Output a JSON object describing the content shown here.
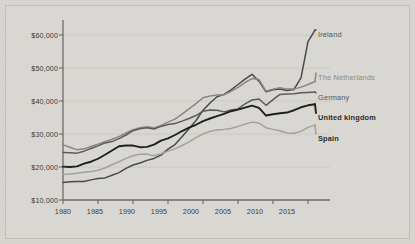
{
  "chart_data": {
    "type": "line",
    "title": "",
    "subtitle": "",
    "xlabel": "",
    "ylabel": "",
    "xlim": [
      1980,
      2017
    ],
    "ylim": [
      10000,
      62000
    ],
    "grid": "horizontal",
    "legend_position": "right-inline-end-of-line",
    "y_ticks": [
      "$10,000",
      "$20,000",
      "$30,000",
      "$40,000",
      "$50,000",
      "$60,000"
    ],
    "y_tick_values": [
      10000,
      20000,
      30000,
      40000,
      50000,
      60000
    ],
    "x_ticks": [
      "1980",
      "1985",
      "1990",
      "1995",
      "2000",
      "2005",
      "2010",
      "2015"
    ],
    "x_tick_values": [
      1980,
      1985,
      1990,
      1995,
      2000,
      2005,
      2010,
      2015
    ],
    "x": [
      1980,
      1981,
      1982,
      1983,
      1984,
      1985,
      1986,
      1987,
      1988,
      1989,
      1990,
      1991,
      1992,
      1993,
      1994,
      1995,
      1996,
      1997,
      1998,
      1999,
      2000,
      2001,
      2002,
      2003,
      2004,
      2005,
      2006,
      2007,
      2008,
      2009,
      2010,
      2011,
      2012,
      2013,
      2014,
      2015,
      2016
    ],
    "series": [
      {
        "name": "Ireland",
        "color": "#4a4a4a",
        "width": 1.5,
        "label_style": "mid",
        "values": [
          15300,
          15500,
          15600,
          15600,
          16100,
          16500,
          16700,
          17500,
          18300,
          19600,
          20600,
          21200,
          22000,
          22600,
          23600,
          25400,
          26800,
          29200,
          31600,
          34100,
          37200,
          39400,
          41300,
          42000,
          43400,
          45000,
          46600,
          48100,
          46000,
          42800,
          43400,
          43600,
          43200,
          43500,
          47000,
          58000,
          61500
        ]
      },
      {
        "name": "The Netherlands",
        "color": "#8a8882",
        "width": 1.5,
        "label_style": "light",
        "values": [
          26700,
          26000,
          25200,
          25500,
          26200,
          26900,
          27700,
          28400,
          29200,
          30300,
          31300,
          31900,
          32200,
          31800,
          32600,
          33600,
          34500,
          36000,
          37600,
          39200,
          41000,
          41500,
          41800,
          41900,
          42900,
          44100,
          45600,
          46800,
          46500,
          43000,
          43600,
          44000,
          43600,
          43600,
          44200,
          45000,
          45900
        ]
      },
      {
        "name": "Germany",
        "color": "#5d5c5a",
        "width": 1.5,
        "label_style": "mid",
        "values": [
          24400,
          24300,
          24200,
          24800,
          25600,
          26400,
          27300,
          27700,
          28600,
          29700,
          31000,
          31600,
          31900,
          31500,
          32300,
          32900,
          33200,
          33900,
          34700,
          35600,
          36900,
          37300,
          37200,
          36700,
          37300,
          37600,
          39100,
          40300,
          40600,
          38700,
          40400,
          42000,
          42100,
          42200,
          42500,
          42600,
          42700
        ]
      },
      {
        "name": "United kingdom",
        "color": "#1e1e1e",
        "width": 1.9,
        "label_style": "dark",
        "values": [
          20100,
          20000,
          20200,
          21000,
          21600,
          22500,
          23700,
          25000,
          26300,
          26500,
          26500,
          26000,
          26100,
          26800,
          28000,
          28700,
          29700,
          30900,
          31900,
          32800,
          33900,
          34700,
          35400,
          36100,
          36900,
          37400,
          38000,
          38600,
          37900,
          35600,
          36000,
          36300,
          36500,
          37200,
          38100,
          38700,
          39000
        ]
      },
      {
        "name": "Spain",
        "color": "#a3a19c",
        "width": 1.5,
        "label_style": "dark",
        "values": [
          17800,
          17900,
          18100,
          18400,
          18600,
          19000,
          19700,
          20700,
          21600,
          22600,
          23400,
          23900,
          23900,
          23400,
          24000,
          24800,
          25500,
          26500,
          27600,
          28900,
          30000,
          30800,
          31200,
          31400,
          31700,
          32300,
          33000,
          33600,
          33300,
          31900,
          31400,
          31000,
          30300,
          30200,
          30800,
          32000,
          32700
        ]
      }
    ]
  },
  "axes": {
    "y_axis_name": "GDP per capita (USD)",
    "x_axis_name": "Year"
  },
  "labels": {
    "ireland": "Ireland",
    "netherlands": "The Netherlands",
    "germany": "Germany",
    "uk": "United kingdom",
    "spain": "Spain"
  },
  "colors": {
    "background": "#d9d7d2",
    "panel": "#dbd9d4",
    "panel_border": "#c3c0ba",
    "axis": "#6d6b68",
    "grid": "#c9c6c0",
    "tick_text": "#3a3a38"
  }
}
